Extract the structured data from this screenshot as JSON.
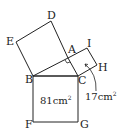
{
  "diagram": {
    "points": {
      "A": {
        "label": "A",
        "x": 68,
        "y": 58
      },
      "B": {
        "label": "B",
        "x": 33,
        "y": 76
      },
      "C": {
        "label": "C",
        "x": 78,
        "y": 76
      },
      "D": {
        "label": "D",
        "x": 51,
        "y": 21
      },
      "E": {
        "label": "E",
        "x": 16,
        "y": 42
      },
      "F": {
        "label": "F",
        "x": 33,
        "y": 122
      },
      "G": {
        "label": "G",
        "x": 78,
        "y": 122
      },
      "H": {
        "label": "H",
        "x": 97,
        "y": 65
      },
      "I": {
        "label": "I",
        "x": 87,
        "y": 48
      }
    },
    "areas": {
      "square_BCGF": {
        "value": "81",
        "unit": "cm",
        "exp": "2"
      },
      "square_ACHI": {
        "value": "17",
        "unit": "cm",
        "exp": "2"
      }
    },
    "stroke_color": "#222222"
  }
}
